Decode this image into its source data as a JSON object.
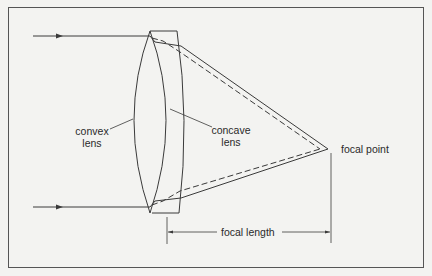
{
  "diagram": {
    "labels": {
      "convex_lens": [
        "convex",
        "lens"
      ],
      "concave_lens": [
        "concave",
        "lens"
      ],
      "focal_point": "focal point",
      "focal_length": "focal length"
    },
    "colors": {
      "background": "#f3f3f1",
      "stroke": "#3a3a3a",
      "frame": "#555555"
    }
  }
}
